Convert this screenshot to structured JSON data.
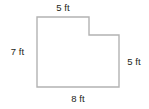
{
  "figure": {
    "name": "composite-rectilinear-polygon",
    "stroke_color": "#b3b3b3",
    "fill_color": "#ffffff",
    "text_color": "#231f20",
    "unit": "ft",
    "vertices": [
      [
        37,
        17
      ],
      [
        89,
        17
      ],
      [
        89,
        35
      ],
      [
        119,
        35
      ],
      [
        119,
        87
      ],
      [
        37,
        87
      ]
    ],
    "labels": {
      "top": "5 ft",
      "left": "7 ft",
      "right": "5 ft",
      "bottom": "8 ft"
    }
  }
}
